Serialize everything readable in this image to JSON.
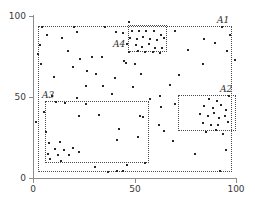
{
  "chart_data": {
    "type": "scatter",
    "title": "",
    "xlabel": "",
    "ylabel": "",
    "xlim": [
      0,
      100
    ],
    "ylim": [
      0,
      100
    ],
    "grid": false,
    "legend": "none",
    "xticks": [
      "0",
      "50",
      "100"
    ],
    "yticks": [
      "0",
      "50",
      "100"
    ],
    "xtick_values": [
      0,
      50,
      100
    ],
    "ytick_values": [
      0,
      50,
      100
    ],
    "marker": "square",
    "marker_color": "#262626",
    "regions": [
      {
        "label": "A1",
        "x0": 2.5,
        "y0": 4.0,
        "x1": 98.0,
        "y1": 94.0,
        "label_pos": "top-right-inside"
      },
      {
        "label": "A2",
        "x0": 71.5,
        "y0": 29.0,
        "x1": 100.0,
        "y1": 51.0,
        "label_pos": "top-right-above"
      },
      {
        "label": "A3",
        "x0": 6.0,
        "y0": 9.0,
        "x1": 57.0,
        "y1": 47.5,
        "label_pos": "top-left-above"
      },
      {
        "label": "A4",
        "x0": 47.0,
        "y0": 78.0,
        "x1": 66.0,
        "y1": 94.5,
        "label_pos": "left-outside"
      }
    ],
    "points": [
      [
        4.5,
        93.5
      ],
      [
        20.0,
        93.0
      ],
      [
        35.5,
        93.5
      ],
      [
        47.5,
        96.5
      ],
      [
        93.0,
        93.5
      ],
      [
        7.0,
        88.0
      ],
      [
        14.5,
        86.5
      ],
      [
        21.5,
        90.0
      ],
      [
        41.0,
        90.0
      ],
      [
        44.5,
        89.5
      ],
      [
        49.0,
        91.0
      ],
      [
        52.0,
        90.5
      ],
      [
        55.5,
        91.0
      ],
      [
        59.5,
        90.5
      ],
      [
        63.0,
        88.0
      ],
      [
        97.0,
        88.5
      ],
      [
        70.0,
        91.0
      ],
      [
        3.5,
        82.0
      ],
      [
        48.0,
        86.5
      ],
      [
        51.0,
        86.0
      ],
      [
        54.0,
        87.0
      ],
      [
        57.5,
        85.5
      ],
      [
        61.0,
        85.0
      ],
      [
        64.5,
        86.5
      ],
      [
        84.0,
        85.5
      ],
      [
        89.5,
        83.5
      ],
      [
        2.5,
        76.5
      ],
      [
        17.0,
        78.5
      ],
      [
        46.5,
        82.5
      ],
      [
        50.5,
        82.0
      ],
      [
        53.5,
        81.0
      ],
      [
        57.0,
        82.5
      ],
      [
        60.0,
        80.5
      ],
      [
        63.5,
        80.0
      ],
      [
        95.5,
        78.5
      ],
      [
        4.0,
        70.5
      ],
      [
        23.0,
        73.5
      ],
      [
        29.0,
        74.5
      ],
      [
        34.0,
        75.0
      ],
      [
        47.5,
        78.0
      ],
      [
        51.5,
        78.5
      ],
      [
        55.0,
        77.5
      ],
      [
        59.0,
        78.0
      ],
      [
        62.5,
        77.0
      ],
      [
        76.5,
        79.0
      ],
      [
        99.5,
        73.0
      ],
      [
        19.5,
        68.5
      ],
      [
        26.5,
        66.0
      ],
      [
        45.0,
        72.5
      ],
      [
        46.0,
        71.0
      ],
      [
        50.0,
        70.5
      ],
      [
        83.5,
        70.5
      ],
      [
        10.5,
        62.5
      ],
      [
        31.0,
        64.0
      ],
      [
        40.5,
        62.0
      ],
      [
        53.0,
        64.5
      ],
      [
        72.0,
        63.5
      ],
      [
        26.0,
        57.0
      ],
      [
        34.5,
        56.5
      ],
      [
        49.5,
        56.0
      ],
      [
        67.5,
        57.5
      ],
      [
        9.5,
        50.5
      ],
      [
        21.5,
        49.5
      ],
      [
        39.0,
        52.0
      ],
      [
        57.5,
        49.0
      ],
      [
        62.5,
        50.5
      ],
      [
        96.5,
        50.5
      ],
      [
        86.5,
        49.0
      ],
      [
        90.5,
        47.5
      ],
      [
        11.5,
        47.0
      ],
      [
        16.0,
        46.5
      ],
      [
        26.0,
        45.5
      ],
      [
        63.0,
        44.0
      ],
      [
        70.0,
        45.5
      ],
      [
        84.0,
        44.5
      ],
      [
        88.5,
        43.0
      ],
      [
        92.5,
        45.0
      ],
      [
        95.0,
        42.0
      ],
      [
        5.5,
        41.0
      ],
      [
        22.5,
        38.5
      ],
      [
        32.5,
        39.0
      ],
      [
        52.5,
        38.5
      ],
      [
        54.0,
        37.5
      ],
      [
        82.5,
        39.5
      ],
      [
        86.0,
        38.0
      ],
      [
        89.0,
        40.0
      ],
      [
        91.5,
        37.0
      ],
      [
        94.5,
        38.5
      ],
      [
        1.5,
        34.5
      ],
      [
        62.0,
        33.0
      ],
      [
        83.5,
        34.0
      ],
      [
        87.5,
        33.0
      ],
      [
        91.0,
        32.5
      ],
      [
        96.0,
        34.5
      ],
      [
        6.5,
        28.5
      ],
      [
        42.5,
        30.5
      ],
      [
        51.5,
        25.5
      ],
      [
        64.5,
        29.0
      ],
      [
        85.0,
        28.5
      ],
      [
        90.0,
        29.5
      ],
      [
        93.5,
        27.0
      ],
      [
        69.0,
        23.0
      ],
      [
        8.0,
        21.5
      ],
      [
        13.5,
        22.0
      ],
      [
        41.5,
        23.5
      ],
      [
        11.0,
        18.0
      ],
      [
        15.5,
        17.5
      ],
      [
        19.5,
        18.5
      ],
      [
        7.5,
        15.0
      ],
      [
        12.5,
        14.0
      ],
      [
        17.5,
        14.5
      ],
      [
        22.5,
        16.0
      ],
      [
        80.0,
        15.0
      ],
      [
        95.0,
        17.5
      ],
      [
        8.5,
        11.5
      ],
      [
        14.0,
        10.5
      ],
      [
        30.5,
        6.5
      ],
      [
        37.0,
        4.0
      ],
      [
        41.5,
        4.5
      ],
      [
        46.5,
        8.0
      ],
      [
        55.0,
        9.5
      ],
      [
        92.0,
        4.5
      ],
      [
        44.5,
        4.5
      ]
    ]
  }
}
